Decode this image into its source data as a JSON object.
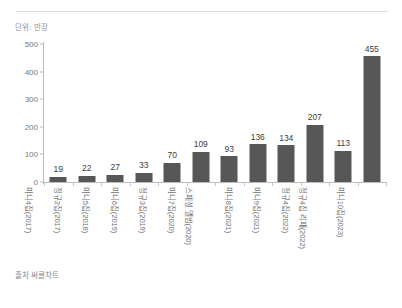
{
  "unit_caption": "단위: 만장",
  "source_note": "출처 써클차트",
  "style": {
    "bar_color": "#575757",
    "axis_color": "#b9bcc0",
    "label_color": "#6f7276",
    "value_color": "#3c3d3f",
    "background": "#ffffff"
  },
  "chart_data": {
    "type": "bar",
    "title": "",
    "subtitle": "",
    "xlabel": "",
    "ylabel": "단위: 만장",
    "ylim": [
      0,
      500
    ],
    "yticks": [
      0,
      100,
      200,
      300,
      400,
      500
    ],
    "grid": false,
    "legend": false,
    "legend_position": "none",
    "categories": [
      "미니4집(2017)",
      "정규2집(2017)",
      "미니5집(2018)",
      "미니6집(2019)",
      "정규3집(2019)",
      "미니7집(2020)",
      "스페셜 앨범(2020)",
      "미니8집(2021)",
      "미니9집(2021)",
      "정규4집(2022)",
      "정규4집 리패(2022)",
      "미니10집(2023)"
    ],
    "values": [
      19,
      22,
      27,
      33,
      70,
      109,
      93,
      136,
      134,
      207,
      113,
      455
    ],
    "data_labels": [
      "19",
      "22",
      "27",
      "33",
      "70",
      "109",
      "93",
      "136",
      "134",
      "207",
      "113",
      "455"
    ],
    "annotations": [
      "단위: 만장",
      "출처 써클차트"
    ]
  }
}
